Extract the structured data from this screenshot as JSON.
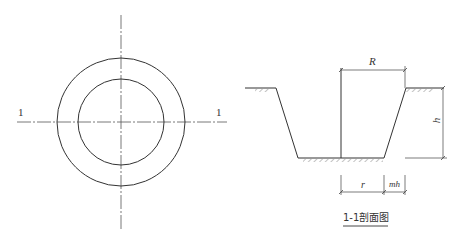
{
  "plan_view": {
    "section_label_left": "1",
    "section_label_right": "1",
    "outer_circle_radius_px": 64,
    "inner_circle_radius_px": 43
  },
  "section_view": {
    "dim_top": "R",
    "dim_height": "h",
    "dim_bottom_left": "r",
    "dim_bottom_right": "mh",
    "title": "1-1剖面图"
  },
  "colors": {
    "line": "#333333",
    "centerline": "#555555",
    "hatch": "#666666"
  }
}
